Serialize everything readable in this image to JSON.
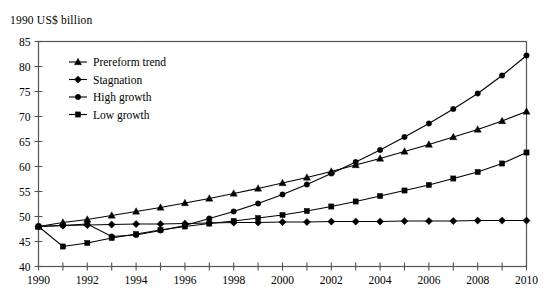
{
  "chart_data": {
    "type": "line",
    "title": "1990 US$ billion",
    "xlabel": "",
    "ylabel": "1990 US$ billion",
    "x": [
      1990,
      1991,
      1992,
      1993,
      1994,
      1995,
      1996,
      1997,
      1998,
      1999,
      2000,
      2001,
      2002,
      2003,
      2004,
      2005,
      2006,
      2007,
      2008,
      2009,
      2010
    ],
    "xlim": [
      1990,
      2010
    ],
    "ylim": [
      40,
      85
    ],
    "yticks": [
      40,
      45,
      50,
      55,
      60,
      65,
      70,
      75,
      80,
      85
    ],
    "xticks": [
      1990,
      1991,
      1992,
      1993,
      1994,
      1995,
      1996,
      1997,
      1998,
      1999,
      2000,
      2001,
      2002,
      2003,
      2004,
      2005,
      2006,
      2007,
      2008,
      2009,
      2010
    ],
    "xtick_labels": [
      "1990",
      "",
      "1992",
      "",
      "1994",
      "",
      "1996",
      "",
      "1998",
      "",
      "2000",
      "",
      "2002",
      "",
      "2004",
      "",
      "2006",
      "",
      "2008",
      "",
      "2010"
    ],
    "ytick_labels": [
      "40",
      "45",
      "50",
      "55",
      "60",
      "65",
      "70",
      "75",
      "80",
      "85"
    ],
    "grid": false,
    "legend_position": "upper-left-inside",
    "series": [
      {
        "name": "Prereform trend",
        "marker": "triangle",
        "values": [
          48.0,
          48.8,
          49.4,
          50.2,
          51.0,
          51.8,
          52.7,
          53.6,
          54.6,
          55.6,
          56.7,
          57.8,
          59.0,
          60.3,
          61.6,
          63.0,
          64.4,
          65.9,
          67.4,
          69.1,
          71.0
        ]
      },
      {
        "name": "Stagnation",
        "marker": "diamond",
        "values": [
          48.0,
          48.2,
          48.3,
          48.4,
          48.5,
          48.5,
          48.6,
          48.7,
          48.8,
          48.8,
          48.9,
          48.9,
          49.0,
          49.0,
          49.0,
          49.1,
          49.1,
          49.1,
          49.2,
          49.2,
          49.2
        ]
      },
      {
        "name": "High growth",
        "marker": "circle",
        "values": [
          48.0,
          48.2,
          48.5,
          46.0,
          46.3,
          47.2,
          48.2,
          49.6,
          51.0,
          52.6,
          54.4,
          56.4,
          58.6,
          60.9,
          63.3,
          65.9,
          68.6,
          71.5,
          74.6,
          78.2,
          82.2
        ]
      },
      {
        "name": "Low growth",
        "marker": "square",
        "values": [
          48.0,
          44.0,
          44.7,
          45.7,
          46.5,
          47.3,
          48.0,
          48.6,
          49.1,
          49.7,
          50.3,
          51.1,
          52.0,
          53.0,
          54.1,
          55.2,
          56.3,
          57.6,
          58.9,
          60.6,
          62.8
        ]
      }
    ]
  },
  "legend": {
    "items": [
      {
        "label": "Prereform trend",
        "marker": "triangle"
      },
      {
        "label": "Stagnation",
        "marker": "diamond"
      },
      {
        "label": "High growth",
        "marker": "circle"
      },
      {
        "label": "Low growth",
        "marker": "square"
      }
    ]
  }
}
